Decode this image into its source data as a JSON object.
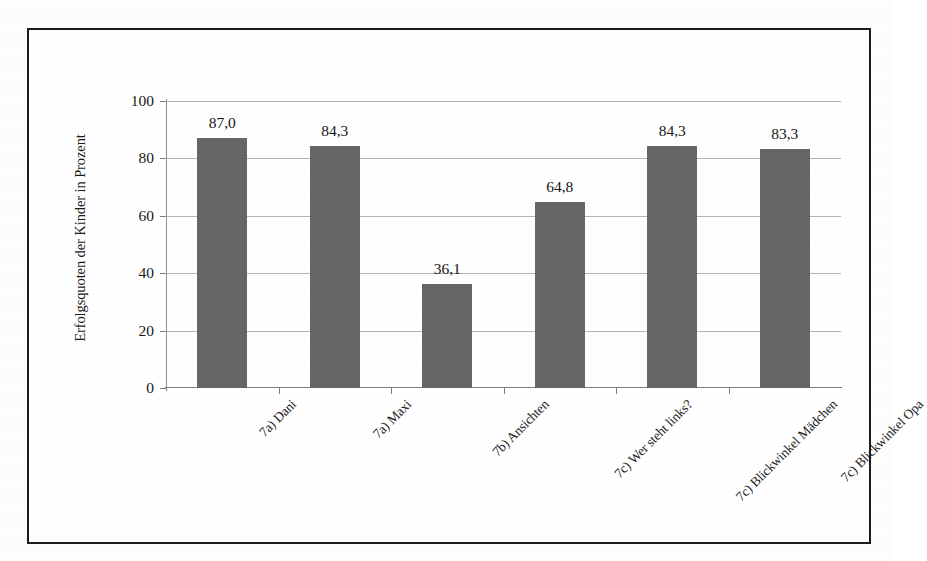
{
  "chart_data": {
    "type": "bar",
    "title": "",
    "xlabel": "",
    "ylabel": "Erfolgsquoten der Kinder in Prozent",
    "ylim": [
      0,
      100
    ],
    "yticks": [
      0,
      20,
      40,
      60,
      80,
      100
    ],
    "ytick_labels": [
      "0",
      "20",
      "40",
      "60",
      "80",
      "100"
    ],
    "grid": true,
    "legend": "none",
    "bar_color": "#666666",
    "categories": [
      "7a) Dani",
      "7a) Maxi",
      "7b) Ansichten",
      "7c) Wer steht links?",
      "7c) Blickwinkel Mädchen",
      "7c) Blickwinkel Opa"
    ],
    "values": [
      87.0,
      84.3,
      36.1,
      64.8,
      84.3,
      83.3
    ],
    "data_labels": [
      "87,0",
      "84,3",
      "36,1",
      "64,8",
      "84,3",
      "83,3"
    ],
    "decimal_separator": ",",
    "bars": [
      {
        "category": "7a) Dani",
        "value": 87.0,
        "label": "87,0"
      },
      {
        "category": "7a) Maxi",
        "value": 84.3,
        "label": "84,3"
      },
      {
        "category": "7b) Ansichten",
        "value": 36.1,
        "label": "36,1"
      },
      {
        "category": "7c) Wer steht links?",
        "value": 64.8,
        "label": "64,8"
      },
      {
        "category": "7c) Blickwinkel Mädchen",
        "value": 84.3,
        "label": "84,3"
      },
      {
        "category": "7c) Blickwinkel Opa",
        "value": 83.3,
        "label": "83,3"
      }
    ]
  },
  "axes": {
    "y_title": "Erfolgsquoten der Kinder in Prozent",
    "y_tick_0": "0",
    "y_tick_1": "20",
    "y_tick_2": "40",
    "y_tick_3": "60",
    "y_tick_4": "80",
    "y_tick_5": "100"
  },
  "frame": {
    "border_color": "#1c1c1c",
    "background": "#ffffff"
  }
}
